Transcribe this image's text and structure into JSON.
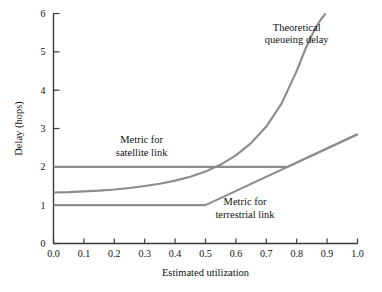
{
  "chart_data": {
    "type": "line",
    "title": "",
    "xlabel": "Estimated utilization",
    "ylabel": "Delay (hops)",
    "xlim": [
      0.0,
      1.0
    ],
    "ylim": [
      0,
      6
    ],
    "grid": false,
    "legend_position": "inline-annotations",
    "line_color": "#8c8c8c",
    "axis_color": "#3a3a3a",
    "xticks": [
      0.0,
      0.1,
      0.2,
      0.3,
      0.4,
      0.5,
      0.6,
      0.7,
      0.8,
      0.9,
      1.0
    ],
    "xtick_labels": [
      "0.0",
      "0.1",
      "0.2",
      "0.3",
      "0.4",
      "0.5",
      "0.6",
      "0.7",
      "0.8",
      "0.9",
      "1.0"
    ],
    "yticks": [
      0,
      1,
      2,
      3,
      4,
      5,
      6
    ],
    "ytick_labels": [
      "0",
      "1",
      "2",
      "3",
      "4",
      "5",
      "6"
    ],
    "series": [
      {
        "name": "Theoretical queueing delay",
        "x": [
          0.0,
          0.05,
          0.1,
          0.15,
          0.2,
          0.25,
          0.3,
          0.35,
          0.4,
          0.45,
          0.5,
          0.55,
          0.6,
          0.65,
          0.7,
          0.75,
          0.8,
          0.83,
          0.86,
          0.88,
          0.895
        ],
        "values": [
          1.33,
          1.34,
          1.36,
          1.38,
          1.41,
          1.45,
          1.5,
          1.56,
          1.64,
          1.74,
          1.88,
          2.06,
          2.3,
          2.62,
          3.05,
          3.65,
          4.5,
          5.1,
          5.6,
          5.85,
          6.0
        ]
      },
      {
        "name": "Metric for satellite link",
        "x": [
          0.0,
          0.77,
          1.0
        ],
        "values": [
          2.0,
          2.0,
          2.85
        ]
      },
      {
        "name": "Metric for terrestrial link",
        "x": [
          0.0,
          0.5,
          1.0
        ],
        "values": [
          1.0,
          1.0,
          2.85
        ]
      }
    ],
    "annotations": [
      {
        "name": "theoretical-queueing-delay-label",
        "lines": [
          "Theoretical",
          "queueing delay"
        ],
        "x": 0.8,
        "y": 5.55
      },
      {
        "name": "metric-satellite-link-label",
        "lines": [
          "Metric for",
          "satellite link"
        ],
        "x": 0.29,
        "y": 2.62
      },
      {
        "name": "metric-terrestrial-link-label",
        "lines": [
          "Metric for",
          "terrestrial link"
        ],
        "x": 0.63,
        "y": 1.0
      }
    ]
  }
}
